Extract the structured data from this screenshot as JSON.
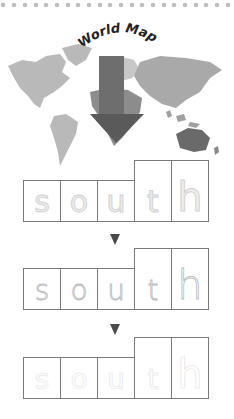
{
  "title": "World Map",
  "word": "south",
  "letters": [
    "s",
    "o",
    "u",
    "t",
    "h"
  ],
  "tall_letters": [
    "t",
    "h"
  ],
  "rows": [
    {
      "style": "solid",
      "letters": [
        "s",
        "o",
        "u",
        "t",
        "h"
      ]
    },
    {
      "style": "dashed",
      "letters": [
        "s",
        "o",
        "u",
        "t",
        "h"
      ]
    },
    {
      "style": "faint",
      "letters": [
        "s",
        "o",
        "u",
        "t",
        "h"
      ]
    }
  ],
  "icons": {
    "map_arrow": "down-arrow-icon",
    "step_marker": "triangle-down-icon"
  },
  "colors": {
    "arrow": "#5e5e5e",
    "highlight_region": "#8c8c8c",
    "continent": "#b9b9b9",
    "box_border": "#7a7a7a",
    "dots": "#bdbdbd"
  }
}
